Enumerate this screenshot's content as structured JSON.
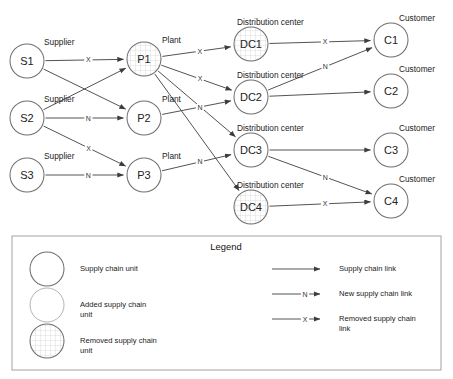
{
  "diagram": {
    "title": "",
    "node_radius": 17,
    "colors": {
      "stroke": "#6f6f6f",
      "edge": "#4a4a4a",
      "text": "#222222",
      "hatch": "#c9c9c9",
      "legend_border": "#9a9a9a"
    },
    "nodes": [
      {
        "id": "S1",
        "label": "S1",
        "type_label": "Supplier",
        "x": 27,
        "y": 61,
        "style": "plain",
        "label_dx": 17,
        "label_dy": -16
      },
      {
        "id": "S2",
        "label": "S2",
        "type_label": "Supplier",
        "x": 27,
        "y": 118,
        "style": "plain",
        "label_dx": 17,
        "label_dy": -16
      },
      {
        "id": "S3",
        "label": "S3",
        "type_label": "Supplier",
        "x": 27,
        "y": 175,
        "style": "plain",
        "label_dx": 17,
        "label_dy": -16
      },
      {
        "id": "P1",
        "label": "P1",
        "type_label": "Plant",
        "x": 144,
        "y": 59,
        "style": "removed",
        "label_dx": 18,
        "label_dy": -16
      },
      {
        "id": "P2",
        "label": "P2",
        "type_label": "Plant",
        "x": 144,
        "y": 118,
        "style": "plain",
        "label_dx": 18,
        "label_dy": -16
      },
      {
        "id": "P3",
        "label": "P3",
        "type_label": "Plant",
        "x": 144,
        "y": 175,
        "style": "plain",
        "label_dx": 18,
        "label_dy": -16
      },
      {
        "id": "DC1",
        "label": "DC1",
        "type_label": "Distribution center",
        "x": 251,
        "y": 44,
        "style": "removed",
        "label_dx": -14,
        "label_dy": -19
      },
      {
        "id": "DC2",
        "label": "DC2",
        "type_label": "Distribution center",
        "x": 251,
        "y": 97,
        "style": "plain",
        "label_dx": -14,
        "label_dy": -19
      },
      {
        "id": "DC3",
        "label": "DC3",
        "type_label": "Distribution center",
        "x": 251,
        "y": 150,
        "style": "plain",
        "label_dx": -14,
        "label_dy": -19
      },
      {
        "id": "DC4",
        "label": "DC4",
        "type_label": "Distribution center",
        "x": 251,
        "y": 207,
        "style": "removed",
        "label_dx": -14,
        "label_dy": -19
      },
      {
        "id": "C1",
        "label": "C1",
        "type_label": "Customer",
        "x": 391,
        "y": 40,
        "style": "plain",
        "label_dx": 8,
        "label_dy": -19
      },
      {
        "id": "C2",
        "label": "C2",
        "type_label": "Customer",
        "x": 391,
        "y": 91,
        "style": "plain",
        "label_dx": 8,
        "label_dy": -19
      },
      {
        "id": "C3",
        "label": "C3",
        "type_label": "Customer",
        "x": 391,
        "y": 150,
        "style": "plain",
        "label_dx": 8,
        "label_dy": -19
      },
      {
        "id": "C4",
        "label": "C4",
        "type_label": "Customer",
        "x": 391,
        "y": 201,
        "style": "plain",
        "label_dx": 8,
        "label_dy": -19
      }
    ],
    "edges": [
      {
        "from": "S1",
        "to": "P1",
        "mark": "X",
        "kind": "removed"
      },
      {
        "from": "S1",
        "to": "P2",
        "mark": "",
        "kind": "normal"
      },
      {
        "from": "S2",
        "to": "P1",
        "mark": "",
        "kind": "normal"
      },
      {
        "from": "S2",
        "to": "P2",
        "mark": "N",
        "kind": "new"
      },
      {
        "from": "S2",
        "to": "P3",
        "mark": "X",
        "kind": "removed"
      },
      {
        "from": "S3",
        "to": "P3",
        "mark": "N",
        "kind": "new"
      },
      {
        "from": "P1",
        "to": "DC1",
        "mark": "X",
        "kind": "removed"
      },
      {
        "from": "P1",
        "to": "DC2",
        "mark": "X",
        "kind": "removed"
      },
      {
        "from": "P1",
        "to": "DC3",
        "mark": "X",
        "kind": "removed"
      },
      {
        "from": "P1",
        "to": "DC4",
        "mark": "",
        "kind": "removed"
      },
      {
        "from": "P2",
        "to": "DC2",
        "mark": "N",
        "kind": "new"
      },
      {
        "from": "P3",
        "to": "DC3",
        "mark": "N",
        "kind": "new"
      },
      {
        "from": "DC1",
        "to": "C1",
        "mark": "X",
        "kind": "removed"
      },
      {
        "from": "DC2",
        "to": "C1",
        "mark": "N",
        "kind": "new"
      },
      {
        "from": "DC2",
        "to": "C2",
        "mark": "",
        "kind": "normal"
      },
      {
        "from": "DC3",
        "to": "C3",
        "mark": "",
        "kind": "normal"
      },
      {
        "from": "DC3",
        "to": "C4",
        "mark": "N",
        "kind": "new"
      },
      {
        "from": "DC4",
        "to": "C4",
        "mark": "X",
        "kind": "removed"
      }
    ]
  },
  "legend": {
    "title": "Legend",
    "units": [
      {
        "style": "plain",
        "label": "Supply chain unit"
      },
      {
        "style": "added",
        "label": "Added supply chain unit"
      },
      {
        "style": "removed",
        "label": "Removed supply chain unit"
      }
    ],
    "links": [
      {
        "mark": "",
        "label": "Supply chain link"
      },
      {
        "mark": "N",
        "label": "New supply chain link"
      },
      {
        "mark": "X",
        "label": "Removed supply chain link"
      }
    ]
  }
}
